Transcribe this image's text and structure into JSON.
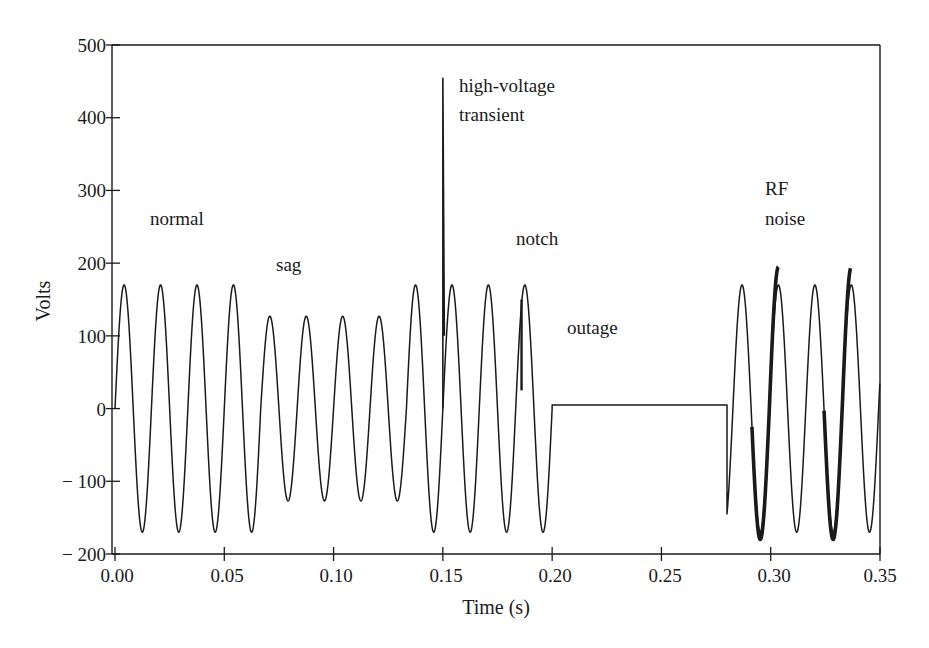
{
  "chart_data": {
    "type": "line",
    "title": "",
    "xlabel": "Time (s)",
    "ylabel": "Volts",
    "xlim": [
      0.0,
      0.35
    ],
    "ylim": [
      -200,
      500
    ],
    "grid": false,
    "legend": null,
    "x_ticks": [
      "0.00",
      "0.05",
      "0.10",
      "0.15",
      "0.20",
      "0.25",
      "0.30",
      "0.35"
    ],
    "y_ticks": [
      "500",
      "400",
      "300",
      "200",
      "100",
      "0",
      "− 100",
      "− 200"
    ],
    "waveform_frequency_hz": 60,
    "segments": [
      {
        "name": "normal",
        "t_start": 0.0,
        "t_end": 0.0667,
        "amplitude_v": 170
      },
      {
        "name": "sag",
        "t_start": 0.0667,
        "t_end": 0.1333,
        "amplitude_v": 127
      },
      {
        "name": "normal",
        "t_start": 0.1333,
        "t_end": 0.15,
        "amplitude_v": 170
      },
      {
        "name": "high-voltage transient",
        "t": 0.15,
        "peak_v": 455,
        "spike_low_v": 100
      },
      {
        "name": "notch",
        "t_start": 0.15,
        "t_end": 0.2,
        "amplitude_v": 170,
        "notch_t": 0.186,
        "notch_drop_to_v": 25
      },
      {
        "name": "outage",
        "t_start": 0.2,
        "t_end": 0.28,
        "level_v": 5
      },
      {
        "name": "RF noise",
        "t_start": 0.28,
        "t_end": 0.35,
        "amplitude_v": 170,
        "noisy_peaks_v": [
          195,
          -180
        ],
        "noisy_cycles_t": [
          0.296,
          0.329
        ]
      }
    ],
    "annotations": [
      {
        "text": "normal",
        "x": 0.02,
        "y": 280
      },
      {
        "text": "sag",
        "x": 0.075,
        "y": 200
      },
      {
        "text": "high-voltage",
        "x": 0.152,
        "y": 440
      },
      {
        "text": "transient",
        "x": 0.152,
        "y": 400
      },
      {
        "text": "notch",
        "x": 0.17,
        "y": 235
      },
      {
        "text": "outage",
        "x": 0.205,
        "y": 105
      },
      {
        "text": "RF",
        "x": 0.308,
        "y": 300
      },
      {
        "text": "noise",
        "x": 0.304,
        "y": 260
      }
    ]
  },
  "labels": {
    "xlabel": "Time (s)",
    "ylabel": "Volts",
    "x_ticks": [
      "0.00",
      "0.05",
      "0.10",
      "0.15",
      "0.20",
      "0.25",
      "0.30",
      "0.35"
    ],
    "y_ticks": [
      "500",
      "400",
      "300",
      "200",
      "100",
      "0",
      "− 100",
      "− 200"
    ],
    "annotations": {
      "normal": "normal",
      "sag": "sag",
      "hv1": "high-voltage",
      "hv2": "transient",
      "notch": "notch",
      "outage": "outage",
      "rf1": "RF",
      "rf2": "noise"
    }
  }
}
